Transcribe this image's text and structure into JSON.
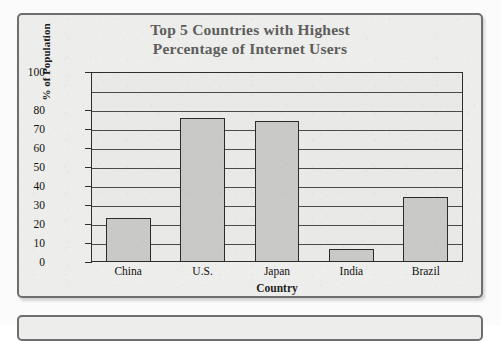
{
  "chart_data": {
    "type": "bar",
    "title": "Top 5 Countries with Highest Percentage of Internet Users",
    "title_line1": "Top 5 Countries with Highest",
    "title_line2": "Percentage of Internet Users",
    "xlabel": "Country",
    "ylabel": "% of Population",
    "categories": [
      "China",
      "U.S.",
      "Japan",
      "India",
      "Brazil"
    ],
    "values": [
      23,
      76,
      74,
      7,
      34
    ],
    "ylim": [
      0,
      100
    ],
    "ytick_labels": [
      "100",
      "80",
      "70",
      "60",
      "50",
      "40",
      "30",
      "20",
      "10",
      "0"
    ],
    "ytick_values": [
      100,
      80,
      70,
      60,
      50,
      40,
      30,
      20,
      10,
      0
    ],
    "gridline_values": [
      100,
      90,
      80,
      70,
      60,
      50,
      40,
      30,
      20,
      10
    ],
    "grid": true,
    "legend": false,
    "bar_color": "#c9c9c7",
    "bar_border_color": "#2b2b2b",
    "axis_color": "#2e2e2e",
    "title_color": "#5d5d5d",
    "panel_background": "#ededeb"
  }
}
